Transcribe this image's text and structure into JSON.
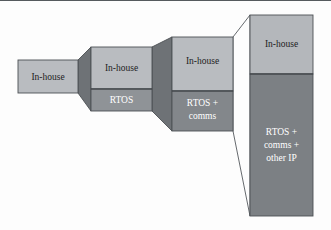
{
  "diagram": {
    "background_color": "#fdfdfd",
    "palette": {
      "in_house_fill": "#b9bcc0",
      "rtos_fill": "#8f9397",
      "rtos_comms_fill": "#83878b",
      "rtos_comms_ip_fill": "#7c8084",
      "in_house_tall_fill": "#b4b7bb",
      "connector_fill": "#6e7276",
      "outline": "#4c5054",
      "text_dark": "#1d1d1d",
      "text_light": "#ffffff"
    },
    "stages": [
      {
        "id": "stage-1",
        "x": 18,
        "y": 59,
        "width": 60,
        "height": 33,
        "segments": [
          {
            "name": "in-house",
            "label": "In-house",
            "lines": [
              "In-house"
            ],
            "fill": "#b9bcc0",
            "text_color": "#1d1d1d",
            "y": 59,
            "height": 33
          }
        ]
      },
      {
        "id": "stage-2",
        "x": 91,
        "y": 46,
        "width": 61,
        "height": 64,
        "segments": [
          {
            "name": "in-house",
            "label": "In-house",
            "lines": [
              "In-house"
            ],
            "fill": "#b9bcc0",
            "text_color": "#1d1d1d",
            "y": 46,
            "height": 42
          },
          {
            "name": "rtos",
            "label": "RTOS",
            "lines": [
              "RTOS"
            ],
            "fill": "#8f9397",
            "text_color": "#ffffff",
            "y": 88,
            "height": 22
          }
        ]
      },
      {
        "id": "stage-3",
        "x": 172,
        "y": 36,
        "width": 61,
        "height": 94,
        "segments": [
          {
            "name": "in-house",
            "label": "In-house",
            "lines": [
              "In-house"
            ],
            "fill": "#b9bcc0",
            "text_color": "#1d1d1d",
            "y": 36,
            "height": 54
          },
          {
            "name": "rtos-comms",
            "label": "RTOS + comms",
            "lines": [
              "RTOS +",
              "comms"
            ],
            "fill": "#83878b",
            "text_color": "#ffffff",
            "y": 90,
            "height": 40
          }
        ]
      },
      {
        "id": "stage-4",
        "x": 250,
        "y": 14,
        "width": 63,
        "height": 201,
        "segments": [
          {
            "name": "in-house",
            "label": "In-house",
            "lines": [
              "In-house"
            ],
            "fill": "#b4b7bb",
            "text_color": "#1d1d1d",
            "y": 14,
            "height": 59
          },
          {
            "name": "rtos-comms-other-ip",
            "label": "RTOS + comms + other IP",
            "lines": [
              "RTOS +",
              "comms +",
              "other IP"
            ],
            "fill": "#7c8084",
            "text_color": "#ffffff",
            "y": 73,
            "height": 142
          }
        ]
      }
    ],
    "connectors": [
      {
        "id": "connector-1-2",
        "name": "connector-stage1-stage2",
        "filled": true,
        "fill": "#6e7276",
        "points": "78,59 91,46 91,110 78,92"
      },
      {
        "id": "connector-2-3",
        "name": "connector-stage2-stage3",
        "filled": true,
        "fill": "#6e7276",
        "points": "152,46 172,36 172,130 152,110"
      },
      {
        "id": "connector-3-4",
        "name": "connector-stage3-stage4",
        "filled": false,
        "fill": "none",
        "points": "233,36 250,14 250,215 233,130"
      }
    ],
    "labels": {
      "in_house": "In-house",
      "rtos": "RTOS",
      "rtos_comms_line1": "RTOS +",
      "rtos_comms_line2": "comms",
      "rtos_comms_ip_line1": "RTOS +",
      "rtos_comms_ip_line2": "comms +",
      "rtos_comms_ip_line3": "other IP"
    }
  }
}
